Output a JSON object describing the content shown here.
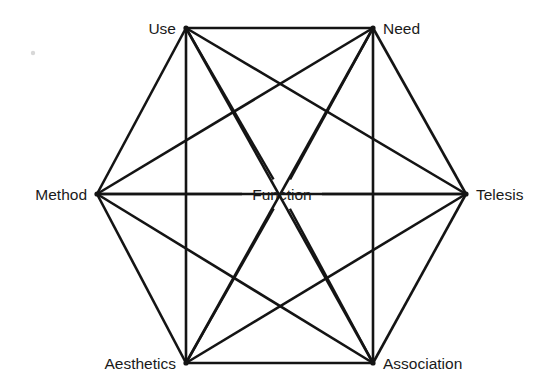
{
  "diagram": {
    "type": "hexagonal-network",
    "center": {
      "id": "function",
      "label": "Function",
      "x": 282,
      "y": 194,
      "label_anchor": "middle",
      "label_x": 282,
      "label_y": 200
    },
    "nodes": [
      {
        "id": "use",
        "label": "Use",
        "x": 186,
        "y": 28,
        "label_x": 176,
        "label_y": 34,
        "anchor": "end"
      },
      {
        "id": "need",
        "label": "Need",
        "x": 373,
        "y": 28,
        "label_x": 383,
        "label_y": 34,
        "anchor": "start"
      },
      {
        "id": "telesis",
        "label": "Telesis",
        "x": 466,
        "y": 194,
        "label_x": 476,
        "label_y": 200,
        "anchor": "start"
      },
      {
        "id": "association",
        "label": "Association",
        "x": 373,
        "y": 363,
        "label_x": 383,
        "label_y": 369,
        "anchor": "start"
      },
      {
        "id": "aesthetics",
        "label": "Aesthetics",
        "x": 186,
        "y": 363,
        "label_x": 176,
        "label_y": 369,
        "anchor": "end"
      },
      {
        "id": "method",
        "label": "Method",
        "x": 97,
        "y": 194,
        "label_x": 87,
        "label_y": 200,
        "anchor": "end"
      }
    ],
    "perimeter_edges": [
      {
        "from": "use",
        "to": "need"
      },
      {
        "from": "need",
        "to": "telesis"
      },
      {
        "from": "telesis",
        "to": "association"
      },
      {
        "from": "association",
        "to": "aesthetics"
      },
      {
        "from": "aesthetics",
        "to": "method"
      },
      {
        "from": "method",
        "to": "use"
      }
    ],
    "chord_edges": [
      {
        "from": "use",
        "to": "telesis"
      },
      {
        "from": "use",
        "to": "association"
      },
      {
        "from": "use",
        "to": "aesthetics"
      },
      {
        "from": "need",
        "to": "method"
      },
      {
        "from": "need",
        "to": "aesthetics"
      },
      {
        "from": "need",
        "to": "association"
      },
      {
        "from": "telesis",
        "to": "aesthetics"
      },
      {
        "from": "telesis",
        "to": "method"
      },
      {
        "from": "association",
        "to": "method"
      }
    ],
    "center_spokes": [
      {
        "from": "function",
        "to": "use"
      },
      {
        "from": "function",
        "to": "need"
      },
      {
        "from": "function",
        "to": "telesis"
      },
      {
        "from": "function",
        "to": "association"
      },
      {
        "from": "function",
        "to": "aesthetics"
      },
      {
        "from": "function",
        "to": "method"
      }
    ],
    "center_gap": {
      "rx": 40,
      "ry": 15
    },
    "style": {
      "line_color": "#141414",
      "line_width": 2.6,
      "background": "#ffffff",
      "label_color": "#1a1a1a",
      "label_size_px": 15.5
    },
    "artifact": {
      "id": "scan-speck",
      "x": 33,
      "y": 53,
      "r": 2.2
    }
  }
}
